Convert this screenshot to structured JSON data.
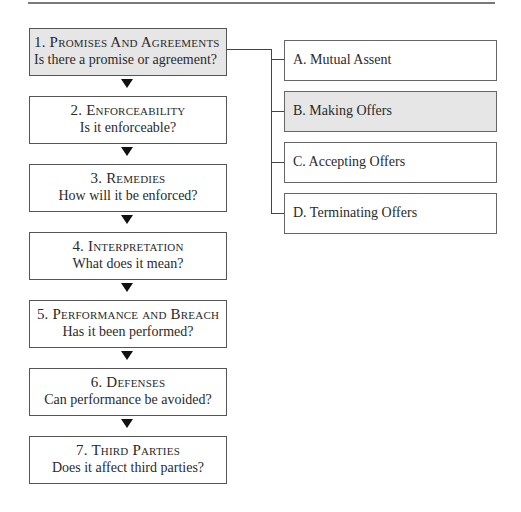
{
  "steps": [
    {
      "num": "1.",
      "title": "Promises And Agreements",
      "question": "Is there a promise or agreement?",
      "active": true
    },
    {
      "num": "2.",
      "title": "Enforceability",
      "question": "Is it enforceable?",
      "active": false
    },
    {
      "num": "3.",
      "title": "Remedies",
      "question": "How will it be enforced?",
      "active": false
    },
    {
      "num": "4.",
      "title": "Interpretation",
      "question": "What does it mean?",
      "active": false
    },
    {
      "num": "5.",
      "title": "Performance and Breach",
      "question": "Has it been performed?",
      "active": false
    },
    {
      "num": "6.",
      "title": "Defenses",
      "question": "Can performance be avoided?",
      "active": false
    },
    {
      "num": "7.",
      "title": "Third Parties",
      "question": "Does it affect third parties?",
      "active": false
    }
  ],
  "substeps": [
    {
      "label": "A.  Mutual Assent",
      "active": false
    },
    {
      "label": "B.  Making Offers",
      "active": true
    },
    {
      "label": "C.  Accepting Offers",
      "active": false
    },
    {
      "label": "D.  Terminating Offers",
      "active": false
    }
  ],
  "colors": {
    "active_fill": "#e6e6e6",
    "border": "#555555",
    "arrow": "#111111"
  }
}
